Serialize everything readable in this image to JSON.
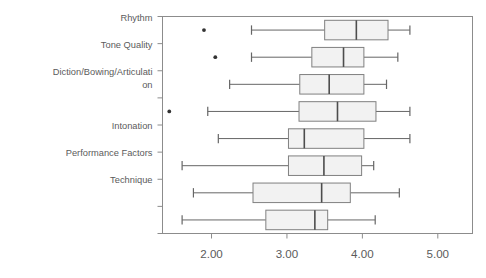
{
  "chart_data": {
    "type": "box",
    "title": "",
    "xlabel": "",
    "ylabel": "",
    "orientation": "horizontal",
    "grid": false,
    "legend": false,
    "xlim": [
      1.35,
      5.46
    ],
    "xticks": [
      2.0,
      3.0,
      4.0,
      5.0
    ],
    "xtick_labels": [
      "2.00",
      "3.00",
      "4.00",
      "5.00"
    ],
    "category_labels": [
      "Rhythm",
      "Tone Quality",
      "Diction/Bowing/Articulati\non",
      "Intonation",
      "Performance Factors",
      "Technique"
    ],
    "categories": [
      "Rhythm",
      "Tone Quality",
      "Diction/Bowing/Articulation",
      "",
      "Intonation",
      "Performance Factors",
      "Technique",
      ""
    ],
    "boxes": [
      {
        "category": "Rhythm",
        "whisker_low": 2.53,
        "q1": 3.5,
        "median": 3.92,
        "q3": 4.34,
        "whisker_high": 4.63,
        "outliers": [
          1.9
        ]
      },
      {
        "category": "Tone Quality",
        "whisker_low": 2.53,
        "q1": 3.33,
        "median": 3.75,
        "q3": 4.02,
        "whisker_high": 4.47,
        "outliers": [
          2.05
        ]
      },
      {
        "category": "Diction/Bowing/Articulation",
        "whisker_low": 2.24,
        "q1": 3.17,
        "median": 3.56,
        "q3": 4.02,
        "whisker_high": 4.32,
        "outliers": []
      },
      {
        "category": "",
        "whisker_low": 1.95,
        "q1": 3.16,
        "median": 3.67,
        "q3": 4.18,
        "whisker_high": 4.63,
        "outliers": [
          1.44
        ]
      },
      {
        "category": "Intonation",
        "whisker_low": 2.09,
        "q1": 3.02,
        "median": 3.23,
        "q3": 4.02,
        "whisker_high": 4.63,
        "outliers": []
      },
      {
        "category": "Performance Factors",
        "whisker_low": 1.61,
        "q1": 3.02,
        "median": 3.49,
        "q3": 3.99,
        "whisker_high": 4.15,
        "outliers": []
      },
      {
        "category": "Technique",
        "whisker_low": 1.76,
        "q1": 2.55,
        "median": 3.46,
        "q3": 3.84,
        "whisker_high": 4.49,
        "outliers": []
      },
      {
        "category": "",
        "whisker_low": 1.61,
        "q1": 2.72,
        "median": 3.37,
        "q3": 3.54,
        "whisker_high": 4.17,
        "outliers": []
      }
    ]
  },
  "style": {
    "box_fill": "#f2f2f2",
    "box_stroke": "#808080",
    "line_color": "#666666",
    "frame_color": "#8c8c8c",
    "text_color": "#5b5b5b",
    "outlier_color": "#333333",
    "background": "#ffffff"
  }
}
